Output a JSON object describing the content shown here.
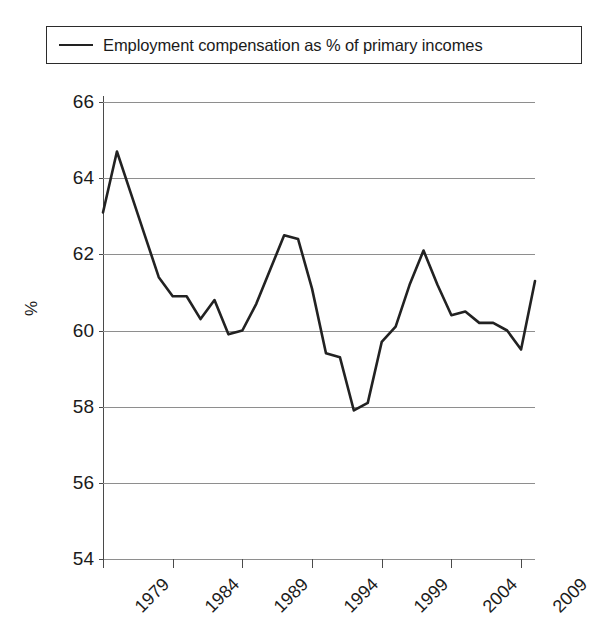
{
  "legend": {
    "label": "Employment compensation as % of primary incomes",
    "swatch": "line-swatch",
    "color": "#222222"
  },
  "axis": {
    "y_title": "%",
    "y_ticks": [
      "66",
      "64",
      "62",
      "60",
      "58",
      "56",
      "54"
    ],
    "x_ticks": [
      "1979",
      "1984",
      "1989",
      "1994",
      "1999",
      "2004",
      "2009"
    ]
  },
  "chart_data": {
    "type": "line",
    "title": "",
    "subtitle": "",
    "xlabel": "",
    "ylabel": "%",
    "ylim": [
      54,
      66
    ],
    "xlim": [
      1979,
      2010
    ],
    "ytick_step": 2,
    "grid": "horizontal",
    "legend_position": "top",
    "x_tick_labels": [
      "1979",
      "1984",
      "1989",
      "1994",
      "1999",
      "2004",
      "2009"
    ],
    "y_tick_labels": [
      "54",
      "56",
      "58",
      "60",
      "62",
      "64",
      "66"
    ],
    "series": [
      {
        "name": "Employment compensation as % of primary incomes",
        "color": "#222222",
        "x": [
          1979,
          1980,
          1981,
          1982,
          1983,
          1984,
          1985,
          1986,
          1987,
          1988,
          1989,
          1990,
          1991,
          1992,
          1993,
          1994,
          1995,
          1996,
          1997,
          1998,
          1999,
          2000,
          2001,
          2002,
          2003,
          2004,
          2005,
          2006,
          2007,
          2008,
          2009,
          2010
        ],
        "values": [
          63.1,
          64.7,
          63.6,
          62.5,
          61.4,
          60.9,
          60.9,
          60.3,
          60.8,
          59.9,
          60.0,
          60.7,
          61.6,
          62.5,
          62.4,
          61.1,
          59.4,
          59.3,
          57.9,
          58.1,
          59.7,
          60.1,
          61.2,
          62.1,
          61.2,
          60.4,
          60.5,
          60.2,
          60.2,
          60.0,
          59.5,
          61.3
        ]
      }
    ]
  }
}
